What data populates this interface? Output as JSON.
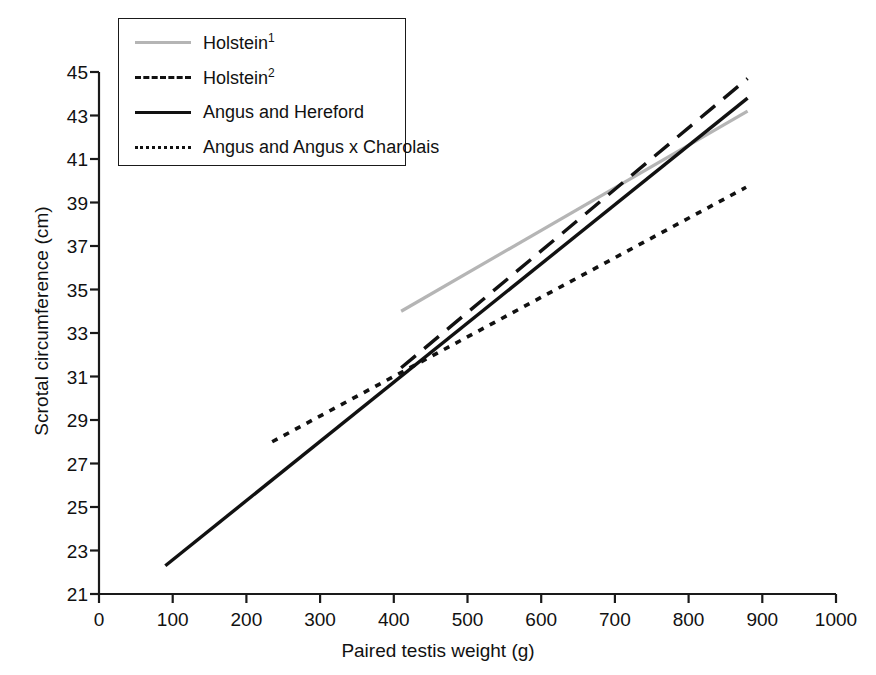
{
  "chart_data": {
    "type": "line",
    "title": "",
    "subtitle": "",
    "xlabel": "Paired testis weight (g)",
    "ylabel": "Scrotal circumference (cm)",
    "xlim": [
      0,
      1000
    ],
    "ylim": [
      21,
      45
    ],
    "xticks": [
      0,
      100,
      200,
      300,
      400,
      500,
      600,
      700,
      800,
      900,
      1000
    ],
    "yticks": [
      21,
      23,
      25,
      27,
      29,
      31,
      33,
      35,
      37,
      39,
      41,
      43,
      45
    ],
    "xtick_labels": [
      "0",
      "100",
      "200",
      "300",
      "400",
      "500",
      "600",
      "700",
      "800",
      "900",
      "1000"
    ],
    "ytick_labels": [
      "21",
      "23",
      "25",
      "27",
      "29",
      "31",
      "33",
      "35",
      "37",
      "39",
      "41",
      "43",
      "45"
    ],
    "grid": false,
    "legend_position": "top-left",
    "series": [
      {
        "name": "Holstein",
        "superscript": "1",
        "label": "Holstein¹",
        "style": "solid",
        "color": "#b5b5b5",
        "width": 3.2,
        "x": [
          410,
          880
        ],
        "y": [
          34.0,
          43.2
        ]
      },
      {
        "name": "Holstein",
        "superscript": "2",
        "label": "Holstein²",
        "style": "dashed",
        "color": "#111111",
        "width": 3.4,
        "x": [
          410,
          880
        ],
        "y": [
          31.4,
          44.7
        ]
      },
      {
        "name": "Angus and Hereford",
        "superscript": "",
        "label": "Angus and Hereford",
        "style": "solid",
        "color": "#111111",
        "width": 3.4,
        "x": [
          90,
          880
        ],
        "y": [
          22.3,
          43.8
        ]
      },
      {
        "name": "Angus and Angus x Charolais",
        "superscript": "",
        "label": "Angus and Angus x Charolais",
        "style": "dotted",
        "color": "#111111",
        "width": 3.6,
        "x": [
          235,
          878
        ],
        "y": [
          28.0,
          39.7
        ]
      }
    ]
  },
  "legend": {
    "entries": [
      {
        "label": "Holstein",
        "sup": "1",
        "key": "k-solid-gray"
      },
      {
        "label": "Holstein",
        "sup": "2",
        "key": "k-dash"
      },
      {
        "label": "Angus and Hereford",
        "sup": "",
        "key": "k-solid"
      },
      {
        "label": "Angus and Angus x Charolais",
        "sup": "",
        "key": "k-dot"
      }
    ]
  }
}
